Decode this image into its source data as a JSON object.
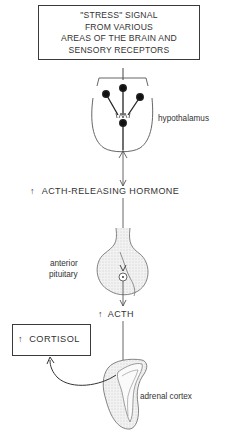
{
  "stress_box": {
    "lines": [
      "\"STRESS\" SIGNAL",
      "FROM VARIOUS",
      "AREAS OF THE BRAIN AND",
      "SENSORY RECEPTORS"
    ]
  },
  "labels": {
    "hypothalamus": "hypothalamus",
    "crh": "ACTH-RELEASING HORMONE",
    "crh_arrow": "↑",
    "pituitary_line1": "anterior",
    "pituitary_line2": "pituitary",
    "acth": "ACTH",
    "acth_arrow": "↑",
    "adrenal": "adrenal cortex"
  },
  "cortisol_box": {
    "arrow": "↑",
    "label": "CORTISOL"
  },
  "colors": {
    "line": "#3a3a3a",
    "shade": "#e8e8e8",
    "background": "#ffffff"
  }
}
